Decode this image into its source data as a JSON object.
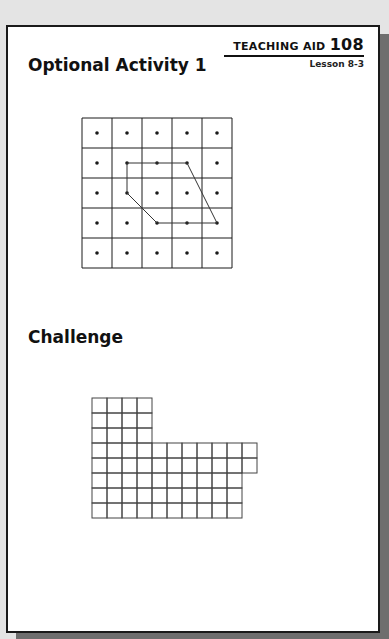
{
  "header": {
    "aid_label": "TEACHING AID",
    "aid_number": "108",
    "lesson": "Lesson 8-3"
  },
  "sections": [
    {
      "title": "Optional Activity 1"
    },
    {
      "title": "Challenge"
    }
  ],
  "dot_grid": {
    "rows": 5,
    "cols": 5,
    "cell_px": 30,
    "polygon_dots": [
      [
        1,
        1
      ],
      [
        1,
        2
      ],
      [
        1,
        3
      ],
      [
        3,
        4
      ],
      [
        3,
        3
      ],
      [
        3,
        2
      ],
      [
        2,
        1
      ],
      [
        1,
        1
      ]
    ]
  },
  "challenge_grid": {
    "cell_px": 15,
    "row_widths": [
      4,
      4,
      4,
      11,
      11,
      10,
      10,
      10
    ]
  },
  "colors": {
    "ink": "#1a1a1a",
    "shadow": "#6e6e6e",
    "background": "#e4e4e4"
  }
}
